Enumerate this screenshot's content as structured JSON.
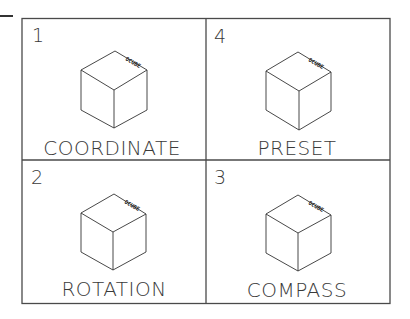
{
  "diagram": {
    "cube_tag": "OCUBE",
    "panels": [
      {
        "number": "1",
        "label": "COORDINATE",
        "position": "top-left"
      },
      {
        "number": "4",
        "label": "PRESET",
        "position": "top-right"
      },
      {
        "number": "2",
        "label": "ROTATION",
        "position": "bottom-left"
      },
      {
        "number": "3",
        "label": "COMPASS",
        "position": "bottom-right"
      }
    ]
  },
  "colors": {
    "line": "#333333",
    "background": "#ffffff"
  }
}
